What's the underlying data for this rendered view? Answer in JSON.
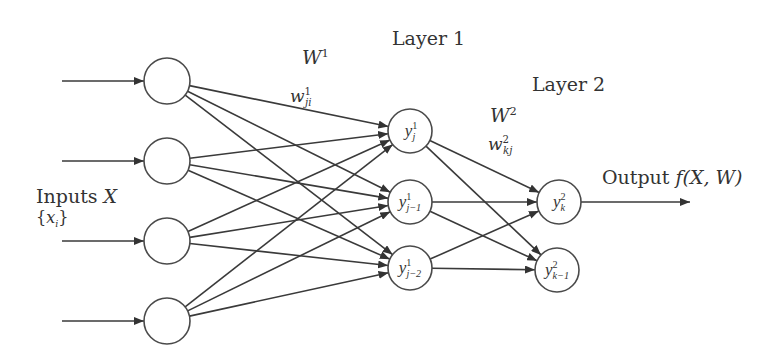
{
  "diagram": {
    "labels": {
      "layer1": "Layer 1",
      "layer2": "Layer 2",
      "W1_base": "W",
      "W1_sup": "1",
      "w1_base": "w",
      "w1_sup": "1",
      "w1_sub": "ji",
      "W2_base": "W",
      "W2_sup": "2",
      "w2_base": "w",
      "w2_sup": "2",
      "w2_sub": "kj",
      "inputs_text": "Inputs ",
      "inputs_var": "X",
      "inputs_set_open": "{",
      "inputs_set_var": "x",
      "inputs_set_sub": "i",
      "inputs_set_close": "}",
      "output_text": "Output ",
      "output_func": "f(X, W)"
    },
    "nodes": {
      "input": [
        {
          "id": "x1",
          "cx": 167,
          "cy": 81
        },
        {
          "id": "x2",
          "cx": 167,
          "cy": 161
        },
        {
          "id": "x3",
          "cx": 167,
          "cy": 241
        },
        {
          "id": "x4",
          "cx": 167,
          "cy": 321
        }
      ],
      "layer1": [
        {
          "id": "yj",
          "cx": 410,
          "cy": 131,
          "base": "y",
          "sup": "1",
          "sub": "j"
        },
        {
          "id": "yj-1",
          "cx": 410,
          "cy": 202,
          "base": "y",
          "sup": "1",
          "sub": "j−1"
        },
        {
          "id": "yj-2",
          "cx": 410,
          "cy": 268,
          "base": "y",
          "sup": "1",
          "sub": "j−2"
        }
      ],
      "layer2": [
        {
          "id": "yk",
          "cx": 559,
          "cy": 202,
          "base": "y",
          "sup": "2",
          "sub": "k"
        },
        {
          "id": "yk-1",
          "cx": 557,
          "cy": 270,
          "base": "y",
          "sup": "2",
          "sub": "k−1"
        }
      ]
    },
    "edges": {
      "inputs": "each input arrow feeds one input node",
      "layer1": "fully connected input -> layer 1",
      "layer2": "fully connected layer 1 -> layer 2",
      "output": "y_k^2 -> Output"
    },
    "colors": {
      "stroke": "#333333",
      "background": "#ffffff"
    }
  }
}
